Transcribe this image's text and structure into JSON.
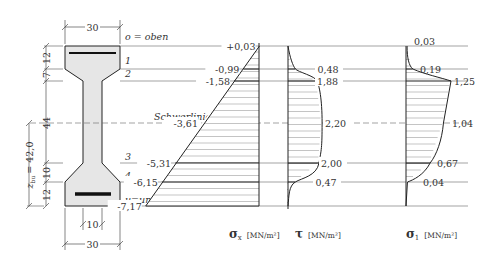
{
  "cross_section": {
    "top_width_label": "30",
    "bottom_width_label": "30",
    "web_width_label": "10",
    "dims_vertical": [
      "12",
      "7",
      "44",
      "10",
      "12"
    ],
    "z_label": "z",
    "z_subscript": "bu",
    "z_value_label": "= 42,0",
    "top_label": "o = oben",
    "bottom_label": "u=unten",
    "centroid_label": "Schwerlinie",
    "fiber_labels": [
      "1",
      "2",
      "3",
      "4"
    ]
  },
  "chart_data": [
    {
      "type": "area",
      "title": "σx [MN/m²]",
      "symbol": "σ",
      "subscript": "x",
      "unit": "[MN/m²]",
      "points": [
        {
          "fiber": "o",
          "value": 0.03,
          "label": "+0,03"
        },
        {
          "fiber": "1",
          "value": -0.99,
          "label": "-0,99"
        },
        {
          "fiber": "2",
          "value": -1.58,
          "label": "-1,58"
        },
        {
          "fiber": "Schwerlinie",
          "value": -3.61,
          "label": "-3,61"
        },
        {
          "fiber": "3",
          "value": -5.31,
          "label": "-5,31"
        },
        {
          "fiber": "4",
          "value": -6.15,
          "label": "-6,15"
        },
        {
          "fiber": "u",
          "value": -7.17,
          "label": "-7,17"
        }
      ]
    },
    {
      "type": "area",
      "title": "τ [MN/m²]",
      "symbol": "τ",
      "subscript": "",
      "unit": "[MN/m²]",
      "points": [
        {
          "fiber": "o",
          "value": 0
        },
        {
          "fiber": "1",
          "value": 0.48,
          "label": "0,48"
        },
        {
          "fiber": "2",
          "value": 1.88,
          "label": "1,88"
        },
        {
          "fiber": "Schwerlinie",
          "value": 2.2,
          "label": "2,20"
        },
        {
          "fiber": "3",
          "value": 2.0,
          "label": "2,00"
        },
        {
          "fiber": "4",
          "value": 0.47,
          "label": "0,47"
        },
        {
          "fiber": "u",
          "value": 0
        }
      ]
    },
    {
      "type": "area",
      "title": "σ1 [MN/m²]",
      "symbol": "σ",
      "subscript": "1",
      "unit": "[MN/m²]",
      "points": [
        {
          "fiber": "o",
          "value": 0.03,
          "label": "0,03"
        },
        {
          "fiber": "1",
          "value": 0.19,
          "label": "0,19"
        },
        {
          "fiber": "2",
          "value": 1.25,
          "label": "1,25"
        },
        {
          "fiber": "Schwerlinie",
          "value": 1.04,
          "label": "1,04"
        },
        {
          "fiber": "3",
          "value": 0.67,
          "label": "0,67"
        },
        {
          "fiber": "4",
          "value": 0.04,
          "label": "0,04"
        },
        {
          "fiber": "u",
          "value": 0
        }
      ]
    }
  ]
}
